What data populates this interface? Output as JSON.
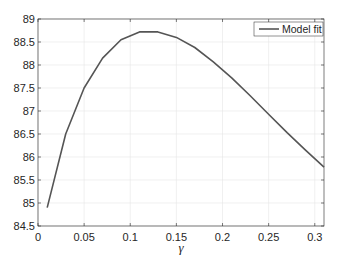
{
  "chart_data": {
    "type": "line",
    "title": "",
    "xlabel": "γ",
    "ylabel": "",
    "xlim": [
      0,
      0.31
    ],
    "ylim": [
      84.5,
      89
    ],
    "grid": true,
    "legend_position": "upper right",
    "xticks": [
      0,
      0.05,
      0.1,
      0.15,
      0.2,
      0.25,
      0.3
    ],
    "xtick_labels": [
      "0",
      "0.05",
      "0.1",
      "0.15",
      "0.2",
      "0.25",
      "0.3"
    ],
    "yticks": [
      84.5,
      85,
      85.5,
      86,
      86.5,
      87,
      87.5,
      88,
      88.5,
      89
    ],
    "ytick_labels": [
      "84.5",
      "85",
      "85.5",
      "86",
      "86.5",
      "87",
      "87.5",
      "88",
      "88.5",
      "89"
    ],
    "series": [
      {
        "name": "Model fit",
        "color": "#555555",
        "x": [
          0.01,
          0.03,
          0.05,
          0.07,
          0.09,
          0.11,
          0.13,
          0.15,
          0.17,
          0.19,
          0.21,
          0.23,
          0.25,
          0.27,
          0.29,
          0.31
        ],
        "y": [
          84.9,
          86.5,
          87.5,
          88.15,
          88.55,
          88.72,
          88.72,
          88.6,
          88.38,
          88.07,
          87.72,
          87.33,
          86.93,
          86.53,
          86.15,
          85.78
        ]
      }
    ]
  },
  "legend": {
    "label": "Model fit"
  }
}
